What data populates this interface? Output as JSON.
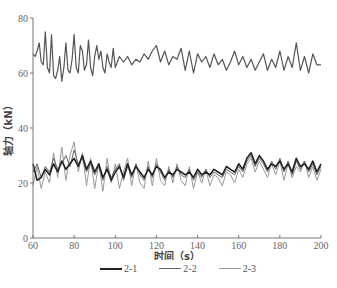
{
  "chart_data": {
    "type": "line",
    "title": "",
    "xlabel": "时间（s）",
    "ylabel": "轴力（kN）",
    "xlim": [
      60,
      200
    ],
    "ylim": [
      0,
      80
    ],
    "x_ticks": [
      60,
      80,
      100,
      120,
      140,
      160,
      180,
      200
    ],
    "y_ticks": [
      0,
      20,
      40,
      60,
      80
    ],
    "grid": false,
    "legend_position": "bottom",
    "series": [
      {
        "name": "2-1",
        "color": "#222222",
        "width": 1.6,
        "x": [
          60,
          62,
          64,
          66,
          68,
          70,
          72,
          74,
          76,
          78,
          80,
          82,
          84,
          86,
          88,
          90,
          92,
          94,
          96,
          98,
          100,
          102,
          104,
          106,
          108,
          110,
          112,
          114,
          116,
          118,
          120,
          122,
          124,
          126,
          128,
          130,
          132,
          134,
          136,
          138,
          140,
          142,
          144,
          146,
          148,
          150,
          152,
          154,
          156,
          158,
          160,
          162,
          164,
          166,
          168,
          170,
          172,
          174,
          176,
          178,
          180,
          182,
          184,
          186,
          188,
          190,
          192,
          194,
          196,
          198,
          200
        ],
        "values": [
          27,
          21,
          22,
          25,
          23,
          27,
          24,
          28,
          25,
          27,
          29,
          26,
          30,
          25,
          28,
          24,
          27,
          22,
          25,
          21,
          24,
          26,
          22,
          27,
          23,
          26,
          24,
          22,
          25,
          23,
          26,
          25,
          22,
          24,
          23,
          25,
          24,
          23,
          24,
          22,
          25,
          23,
          24,
          23,
          25,
          24,
          23,
          26,
          25,
          24,
          27,
          25,
          29,
          31,
          27,
          30,
          28,
          25,
          27,
          26,
          28,
          25,
          27,
          24,
          29,
          26,
          27,
          25,
          28,
          24,
          27
        ]
      },
      {
        "name": "2-2",
        "color": "#666666",
        "width": 1.0,
        "x": [
          60,
          62,
          64,
          66,
          68,
          70,
          72,
          74,
          76,
          78,
          80,
          82,
          84,
          86,
          88,
          90,
          92,
          94,
          96,
          98,
          100,
          102,
          104,
          106,
          108,
          110,
          112,
          114,
          116,
          118,
          120,
          122,
          124,
          126,
          128,
          130,
          132,
          134,
          136,
          138,
          140,
          142,
          144,
          146,
          148,
          150,
          152,
          154,
          156,
          158,
          160,
          162,
          164,
          166,
          168,
          170,
          172,
          174,
          176,
          178,
          180,
          182,
          184,
          186,
          188,
          190,
          192,
          194,
          196,
          198,
          200
        ],
        "values": [
          24,
          27,
          22,
          26,
          24,
          29,
          25,
          27,
          30,
          26,
          32,
          27,
          29,
          24,
          27,
          23,
          26,
          21,
          26,
          22,
          25,
          27,
          21,
          26,
          22,
          27,
          23,
          21,
          26,
          22,
          27,
          24,
          21,
          25,
          22,
          26,
          23,
          22,
          25,
          21,
          24,
          22,
          25,
          22,
          24,
          23,
          22,
          25,
          24,
          23,
          26,
          24,
          28,
          30,
          26,
          29,
          27,
          24,
          28,
          25,
          29,
          24,
          28,
          23,
          28,
          25,
          28,
          24,
          27,
          23,
          26
        ]
      },
      {
        "name": "2-3",
        "color": "#999999",
        "width": 1.0,
        "x": [
          60,
          62,
          64,
          66,
          68,
          70,
          72,
          74,
          76,
          78,
          80,
          82,
          84,
          86,
          88,
          90,
          92,
          94,
          96,
          98,
          100,
          102,
          104,
          106,
          108,
          110,
          112,
          114,
          116,
          118,
          120,
          122,
          124,
          126,
          128,
          130,
          132,
          134,
          136,
          138,
          140,
          142,
          144,
          146,
          148,
          150,
          152,
          154,
          156,
          158,
          160,
          162,
          164,
          166,
          168,
          170,
          172,
          174,
          176,
          178,
          180,
          182,
          184,
          186,
          188,
          190,
          192,
          194,
          196,
          198,
          200
        ],
        "values": [
          19,
          26,
          18,
          24,
          20,
          31,
          22,
          33,
          21,
          30,
          35,
          24,
          31,
          19,
          29,
          18,
          27,
          17,
          29,
          20,
          27,
          18,
          24,
          29,
          19,
          27,
          20,
          18,
          28,
          19,
          29,
          21,
          19,
          26,
          20,
          27,
          21,
          19,
          26,
          18,
          24,
          20,
          25,
          19,
          23,
          22,
          19,
          24,
          23,
          20,
          25,
          22,
          27,
          29,
          24,
          28,
          25,
          22,
          27,
          23,
          28,
          21,
          27,
          22,
          26,
          24,
          28,
          22,
          26,
          21,
          25
        ]
      },
      {
        "name": "upper",
        "color": "#555555",
        "width": 1.2,
        "x": [
          60,
          61,
          62,
          63,
          64,
          65,
          66,
          67,
          68,
          69,
          70,
          71,
          72,
          73,
          74,
          75,
          76,
          77,
          78,
          79,
          80,
          81,
          82,
          83,
          84,
          85,
          86,
          87,
          88,
          89,
          90,
          91,
          92,
          93,
          94,
          95,
          96,
          97,
          98,
          99,
          100,
          102,
          104,
          106,
          108,
          110,
          112,
          114,
          116,
          118,
          120,
          122,
          124,
          126,
          128,
          130,
          132,
          134,
          136,
          138,
          140,
          142,
          144,
          146,
          148,
          150,
          152,
          154,
          156,
          158,
          160,
          162,
          164,
          166,
          168,
          170,
          172,
          174,
          176,
          178,
          180,
          182,
          184,
          186,
          188,
          190,
          192,
          194,
          196,
          198,
          200
        ],
        "values": [
          67,
          66,
          68,
          71,
          64,
          63,
          75,
          62,
          60,
          74,
          59,
          58,
          61,
          66,
          57,
          62,
          71,
          61,
          60,
          65,
          74,
          62,
          60,
          70,
          68,
          61,
          63,
          72,
          62,
          59,
          66,
          70,
          65,
          68,
          62,
          60,
          67,
          64,
          62,
          69,
          62,
          66,
          64,
          66,
          63,
          65,
          64,
          67,
          65,
          68,
          70,
          64,
          68,
          63,
          66,
          65,
          69,
          61,
          68,
          60,
          67,
          64,
          66,
          62,
          67,
          63,
          65,
          61,
          64,
          68,
          63,
          66,
          62,
          65,
          61,
          64,
          67,
          61,
          65,
          62,
          68,
          61,
          66,
          62,
          71,
          61,
          66,
          60,
          67,
          63,
          63
        ]
      }
    ]
  },
  "axes": {
    "x_title": "时间（s）",
    "y_title": "轴力（kN）",
    "x_tick_labels": [
      "60",
      "80",
      "100",
      "120",
      "140",
      "160",
      "180",
      "200"
    ],
    "y_tick_labels": [
      "0",
      "20",
      "40",
      "60",
      "80"
    ]
  },
  "legend": {
    "items": [
      {
        "label": "2-1",
        "color": "#222222",
        "thickness": 2
      },
      {
        "label": "2-2",
        "color": "#666666",
        "thickness": 1
      },
      {
        "label": "2-3",
        "color": "#999999",
        "thickness": 1
      }
    ]
  }
}
